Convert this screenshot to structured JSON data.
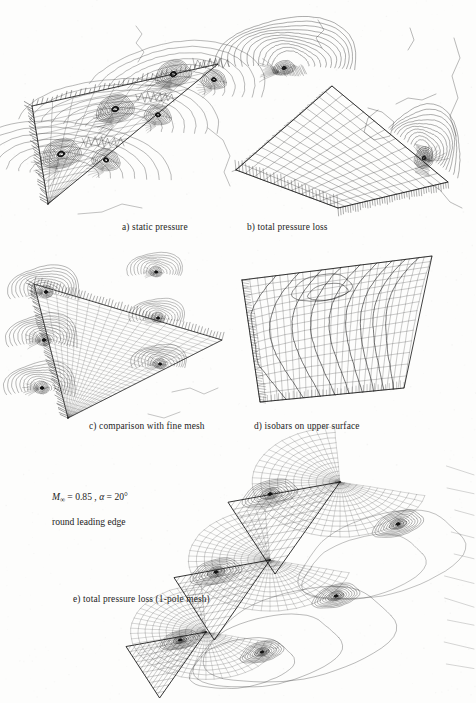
{
  "figure": {
    "title_absent": true,
    "background_color": "#fdfdfc",
    "ink_color": "#1f1f1f",
    "width": 476,
    "height": 703
  },
  "conditions": {
    "mach_symbol": "M",
    "mach_subscript": "∞",
    "mach_equals": " = 0.85 ,  ",
    "alpha_symbol": "α",
    "alpha_equals": " = 20°",
    "full_line": "M∞ = 0.85 ,  α = 20°",
    "line2": "round leading edge"
  },
  "panels": [
    {
      "id": "a",
      "caption": "a) static pressure",
      "caption_x": 122,
      "caption_y": 222,
      "kind": "delta-wing-crossflow-contours",
      "stations": 3,
      "contour_levels": 14,
      "mesh_cols": 18,
      "mesh_rows": 10
    },
    {
      "id": "b",
      "caption": "b) total pressure loss",
      "caption_x": 247,
      "caption_y": 222,
      "kind": "cartesian-mesh-with-vortex-contours",
      "stations": 2,
      "contour_levels": 12,
      "mesh_cols": 16,
      "mesh_rows": 11
    },
    {
      "id": "c",
      "caption": "c) comparison with fine mesh",
      "caption_x": 89,
      "caption_y": 421,
      "kind": "fine-mesh-delta-wing",
      "stations": 3,
      "contour_levels": 9,
      "mesh_cols": 34,
      "mesh_rows": 18
    },
    {
      "id": "d",
      "caption": "d) isobars on upper surface",
      "caption_x": 254,
      "caption_y": 421,
      "kind": "isobars-upper-surface",
      "mesh_cols": 26,
      "mesh_rows": 16,
      "isobar_levels": 9
    },
    {
      "id": "e",
      "caption": "e) total pressure loss (1-pole mesh)",
      "caption_x": 73,
      "caption_y": 600,
      "kind": "polar-one-pole-mesh",
      "stations": 3,
      "contour_levels": 10,
      "radial_spokes": 44,
      "rings": 13
    }
  ],
  "chart_data": {
    "type": "contour",
    "title": "",
    "subtitle": "",
    "xlabel": "",
    "ylabel": "",
    "annotations": [
      "M∞ = 0.85 ,  α = 20°",
      "round leading edge"
    ],
    "subplots": [
      {
        "label": "a) static pressure",
        "quantity": "static pressure",
        "levels": 14,
        "cross_sections": 3,
        "geometry": "delta wing, round leading edge"
      },
      {
        "label": "b) total pressure loss",
        "quantity": "total pressure loss",
        "levels": 12,
        "cross_sections": 2,
        "geometry": "delta wing with cartesian background mesh"
      },
      {
        "label": "c) comparison with fine mesh",
        "quantity": "total pressure loss",
        "levels": 9,
        "cross_sections": 3,
        "geometry": "delta wing, refined mesh"
      },
      {
        "label": "d) isobars on upper surface",
        "quantity": "surface pressure (isobars)",
        "levels": 9,
        "cross_sections": 0,
        "geometry": "delta wing upper surface"
      },
      {
        "label": "e) total pressure loss (1-pole mesh)",
        "quantity": "total pressure loss",
        "levels": 10,
        "cross_sections": 3,
        "geometry": "delta wing, 1-pole (polar) mesh"
      }
    ],
    "flow_conditions": {
      "mach_infinity": 0.85,
      "angle_of_attack_deg": 20,
      "leading_edge": "round"
    }
  }
}
